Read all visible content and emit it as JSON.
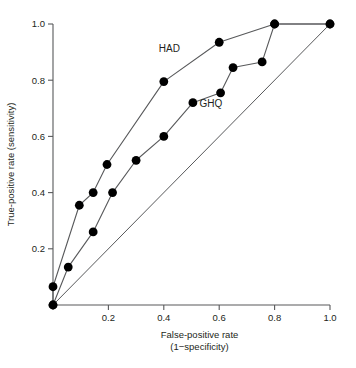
{
  "chart_data": {
    "type": "line",
    "title": "",
    "xlabel": "False-positive rate",
    "xlabel_line2": "(1−specificity)",
    "ylabel": "True-positive rate (sensitivity)",
    "xlim": [
      0.0,
      1.0
    ],
    "ylim": [
      0.0,
      1.0
    ],
    "grid": false,
    "legend_position": "inline-annotations",
    "x_ticks": [
      0.2,
      0.4,
      0.6,
      0.8,
      1.0
    ],
    "x_tick_labels": [
      "0.2",
      "0.4",
      "0.6",
      "0.8",
      "1.0"
    ],
    "y_ticks": [
      0.2,
      0.4,
      0.6,
      0.8,
      1.0
    ],
    "y_tick_labels": [
      "0.2",
      "0.4",
      "0.6",
      "0.8",
      "1.0"
    ],
    "annotations": [
      {
        "text": "HAD",
        "x": 0.42,
        "y": 0.9
      },
      {
        "text": "GHQ",
        "x": 0.57,
        "y": 0.705
      }
    ],
    "reference_line": {
      "name": "chance-diagonal",
      "from": [
        0.0,
        0.0
      ],
      "to": [
        1.0,
        1.0
      ],
      "markers": false
    },
    "series": [
      {
        "name": "HAD",
        "marker": "filled-circle",
        "color": "#000000",
        "points": [
          [
            0.0,
            0.0
          ],
          [
            0.0,
            0.065
          ],
          [
            0.095,
            0.355
          ],
          [
            0.145,
            0.4
          ],
          [
            0.195,
            0.5
          ],
          [
            0.4,
            0.795
          ],
          [
            0.6,
            0.935
          ],
          [
            0.8,
            1.0
          ],
          [
            1.0,
            1.0
          ]
        ]
      },
      {
        "name": "GHQ",
        "marker": "filled-circle",
        "color": "#000000",
        "points": [
          [
            0.0,
            0.0
          ],
          [
            0.055,
            0.135
          ],
          [
            0.145,
            0.26
          ],
          [
            0.215,
            0.4
          ],
          [
            0.3,
            0.515
          ],
          [
            0.4,
            0.6
          ],
          [
            0.505,
            0.72
          ],
          [
            0.605,
            0.755
          ],
          [
            0.65,
            0.845
          ],
          [
            0.755,
            0.865
          ],
          [
            0.8,
            1.0
          ],
          [
            1.0,
            1.0
          ]
        ]
      }
    ],
    "colors": {
      "axis": "#58595b",
      "marker": "#000000",
      "text": "#231f20",
      "background": "#ffffff"
    }
  }
}
